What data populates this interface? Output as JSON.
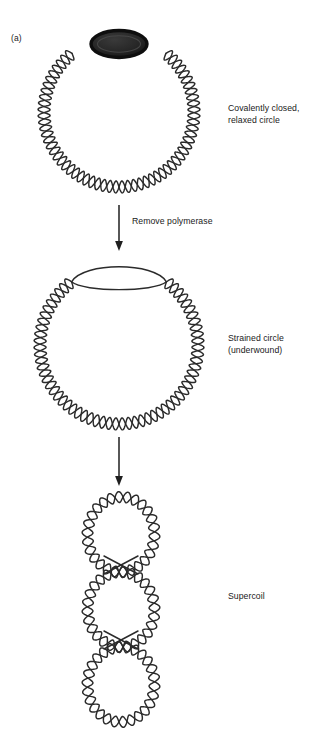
{
  "figure": {
    "panel_label": "(a)",
    "background_color": "#ffffff",
    "stroke_color": "#2b2b2b",
    "polymerase_fill": "#262626",
    "polymerase_stroke": "#111111",
    "width": 326,
    "height": 732
  },
  "stages": [
    {
      "id": "relaxed-circle",
      "label": "Covalently closed,\nrelaxed circle",
      "has_polymerase": true,
      "shape": "circle",
      "center_x": 119,
      "center_y": 112,
      "radius": 75,
      "helix_turns": 30,
      "helix_amplitude": 6
    },
    {
      "id": "strained-circle",
      "label": "Strained circle\n(underwound)",
      "has_polymerase": false,
      "shape": "circle-with-bubble",
      "center_x": 119,
      "center_y": 345,
      "radius": 79,
      "helix_turns": 30,
      "helix_amplitude": 6,
      "bubble_width": 56,
      "bubble_height": 20
    },
    {
      "id": "supercoil",
      "label": "Supercoil",
      "has_polymerase": false,
      "shape": "three-stacked-loops",
      "center_x": 121,
      "top_y": 497,
      "bottom_y": 722,
      "loop_width": 67,
      "loop_count": 3,
      "crossover_y": [
        565,
        640
      ]
    }
  ],
  "arrows": [
    {
      "id": "arrow-remove-polymerase",
      "label": "Remove polymerase",
      "x": 119,
      "y_start": 205,
      "y_end": 251
    },
    {
      "id": "arrow-supercoil",
      "label": "",
      "x": 119,
      "y_start": 437,
      "y_end": 486
    }
  ],
  "icons": {
    "polymerase": "filled-ellipse-icon",
    "arrow": "down-arrow-icon",
    "dna": "dna-double-helix-icon"
  }
}
